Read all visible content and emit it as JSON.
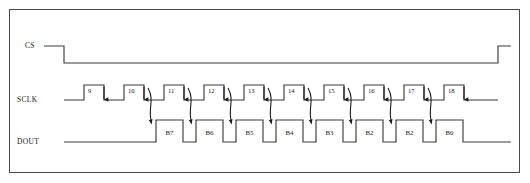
{
  "figure": {
    "type": "timing-diagram",
    "border_color": "#4a4a4a",
    "background": "#ffffff",
    "wire_color": "#3b3b3b"
  },
  "signals": {
    "cs": {
      "label": "CS",
      "idle_level": "high",
      "falling_edge_x": 64,
      "rising_edge_x": 498,
      "high_y": 46,
      "low_y": 63,
      "label_x": 25,
      "label_y": 48
    },
    "sclk": {
      "label": "SCLK",
      "baseline_y": 100,
      "pulse_top_y": 85,
      "label_x": 17,
      "label_y": 102,
      "start_x": 64,
      "end_x": 498,
      "pitch": 40,
      "first_rise_x": 84,
      "pulse_width": 20,
      "pulses": [
        {
          "number": "9",
          "rise_x": 84
        },
        {
          "number": "10",
          "rise_x": 124
        },
        {
          "number": "11",
          "rise_x": 164
        },
        {
          "number": "12",
          "rise_x": 204
        },
        {
          "number": "13",
          "rise_x": 244
        },
        {
          "number": "14",
          "rise_x": 284
        },
        {
          "number": "15",
          "rise_x": 324
        },
        {
          "number": "16",
          "rise_x": 364
        },
        {
          "number": "17",
          "rise_x": 404
        },
        {
          "number": "18",
          "rise_x": 444
        }
      ]
    },
    "dout": {
      "label": "DOUT",
      "baseline_y": 142,
      "bit_top_y": 120,
      "label_x": 17,
      "label_y": 144,
      "start_x": 64,
      "end_x": 511,
      "bit_width": 27,
      "bits": [
        {
          "label": "B7",
          "x": 156
        },
        {
          "label": "B6",
          "x": 196
        },
        {
          "label": "B5",
          "x": 236
        },
        {
          "label": "B4",
          "x": 276
        },
        {
          "label": "B3",
          "x": 316
        },
        {
          "label": "B2",
          "x": 356
        },
        {
          "label": "B2",
          "x": 396
        },
        {
          "label": "B0",
          "x": 436
        }
      ]
    }
  },
  "annotations": {
    "edge_arrows_count": 10,
    "sample_curves_count": 8,
    "note": "curved arrows map SCLK falling edges to DOUT data bits"
  }
}
